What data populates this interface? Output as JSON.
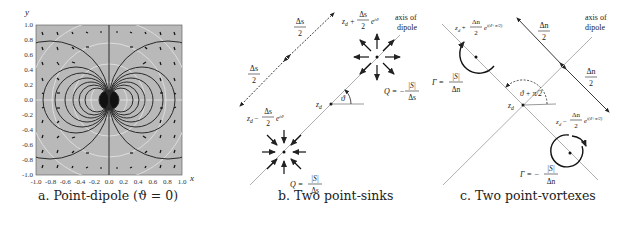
{
  "panels": {
    "a": {
      "caption": "a. Point-dipole (ϑ = 0)",
      "x_axis_label": "x",
      "y_axis_label": "y",
      "x_ticks": [
        "-1.0",
        "-0.8",
        "-0.6",
        "-0.4",
        "-0.2",
        "0.0",
        "0.2",
        "0.4",
        "0.6",
        "0.8",
        "1.0"
      ],
      "y_ticks": [
        "1.0",
        "0.8",
        "0.6",
        "0.4",
        "0.2",
        "0.0",
        "-0.2",
        "-0.4",
        "-0.6",
        "-0.8",
        "-1.0"
      ]
    },
    "b": {
      "caption": "b. Two point-sinks",
      "half_spacing_top": {
        "num": "Δs",
        "den": "2"
      },
      "half_spacing_bottom": {
        "num": "Δs",
        "den": "2"
      },
      "upper_point_label": "z_d + (Δs/2) e^{iϑ}",
      "upper_point_prefix": "z",
      "upper_point_sub": "d",
      "upper_point_op": "+",
      "upper_point_frac_num": "Δs",
      "upper_point_frac_den": "2",
      "upper_point_exp": "e",
      "upper_point_exp_sup": "iϑ",
      "lower_point_op": "−",
      "axis_label_line1": "axis of",
      "axis_label_line2": "dipole",
      "center_label": "z",
      "center_sub": "d",
      "angle_label": "ϑ",
      "upper_strength": {
        "lhs": "Q = −",
        "num": "|S|",
        "den": "Δs"
      },
      "lower_strength": {
        "lhs": "Q =",
        "num": "|S|",
        "den": "Δs"
      }
    },
    "c": {
      "caption": "c. Two point-vortexes",
      "half_spacing_top": {
        "num": "Δn",
        "den": "2"
      },
      "half_spacing_bottom": {
        "num": "Δn",
        "den": "2"
      },
      "upper_point_op": "+",
      "upper_point_frac_num": "Δn",
      "upper_point_frac_den": "2",
      "upper_point_exp_sup": "i(ϑ+π/2)",
      "lower_point_op": "−",
      "axis_label_line1": "axis of",
      "axis_label_line2": "dipole",
      "angle_label": "ϑ + π/2",
      "upper_strength": {
        "lhs": "Γ =",
        "num": "|S|",
        "den": "Δn"
      },
      "lower_strength": {
        "lhs": "Γ = −",
        "num": "|S|",
        "den": "Δn"
      }
    }
  },
  "colors": {
    "plot_bg": "#b8b8b8",
    "curve": "#2a2a2a",
    "axis_gray": "#9a9a9a",
    "white_curve": "#e8e8e8"
  }
}
